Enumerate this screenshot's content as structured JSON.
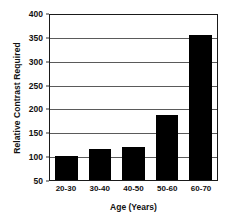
{
  "chart_data": {
    "type": "bar",
    "title": "",
    "subtitle": "",
    "categories": [
      "20-30",
      "30-40",
      "40-50",
      "50-60",
      "60-70"
    ],
    "values": [
      100,
      115,
      120,
      187,
      353
    ],
    "xlabel": "Age (Years)",
    "ylabel": "Relative Contrast Required",
    "ylim": [
      50,
      400
    ],
    "ytick_values": [
      50,
      100,
      150,
      200,
      250,
      300,
      350,
      400
    ],
    "ytick_labels": [
      "50",
      "100",
      "150",
      "200",
      "250",
      "300",
      "350",
      "400"
    ],
    "grid": true,
    "grid_axis": "y",
    "legend": false,
    "legend_position": "none",
    "bar_color": "#000000",
    "plot_background": "#ffffff",
    "frame_color": "#1a1a1a",
    "grid_color": "#5a5a5a",
    "annotations": []
  }
}
